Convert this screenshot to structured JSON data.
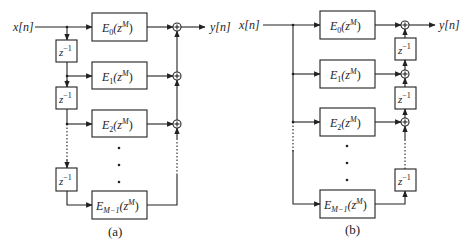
{
  "diagram_a": {
    "caption": "(a)",
    "input_label": "x[n]",
    "output_label": "y[n]",
    "delay_label": "z",
    "delay_exp": "−1",
    "filters": [
      {
        "base": "E",
        "sub": "0",
        "arg": "(z",
        "sup": "M",
        "close": ")"
      },
      {
        "base": "E",
        "sub": "1",
        "arg": "(z",
        "sup": "M",
        "close": ")"
      },
      {
        "base": "E",
        "sub": "2",
        "arg": "(z",
        "sup": "M",
        "close": ")"
      },
      {
        "base": "E",
        "sub": "M−1",
        "arg": "(z",
        "sup": "M",
        "close": ")"
      }
    ],
    "adder_symbol": "+"
  },
  "diagram_b": {
    "caption": "(b)",
    "input_label": "x[n]",
    "output_label": "y[n]",
    "delay_label": "z",
    "delay_exp": "−1",
    "filters": [
      {
        "base": "E",
        "sub": "0",
        "arg": "(z",
        "sup": "M",
        "close": ")"
      },
      {
        "base": "E",
        "sub": "1",
        "arg": "(z",
        "sup": "M",
        "close": ")"
      },
      {
        "base": "E",
        "sub": "2",
        "arg": "(z",
        "sup": "M",
        "close": ")"
      },
      {
        "base": "E",
        "sub": "M−1",
        "arg": "(z",
        "sup": "M",
        "close": ")"
      }
    ],
    "adder_symbol": "+"
  }
}
